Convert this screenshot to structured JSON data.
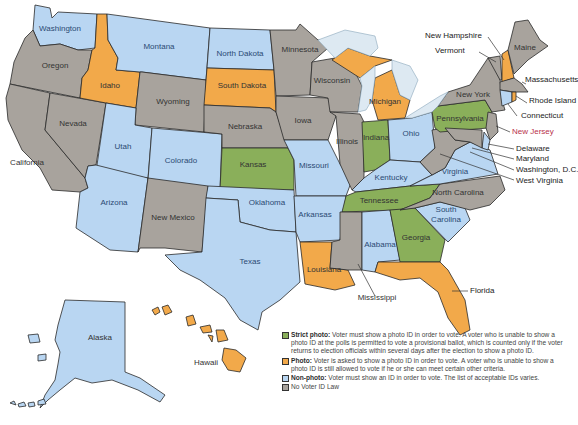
{
  "map": {
    "title": "Voter ID Laws by State",
    "colors": {
      "strict_photo": "#8aaf5a",
      "photo": "#f2a94a",
      "non_photo": "#b9d6f2",
      "none": "#a8a39d",
      "lakes": "#dde9f2"
    },
    "states": [
      {
        "name": "Washington",
        "category": "non_photo"
      },
      {
        "name": "Oregon",
        "category": "none"
      },
      {
        "name": "California",
        "category": "none"
      },
      {
        "name": "Idaho",
        "category": "photo"
      },
      {
        "name": "Nevada",
        "category": "none"
      },
      {
        "name": "Montana",
        "category": "non_photo"
      },
      {
        "name": "Wyoming",
        "category": "none"
      },
      {
        "name": "Utah",
        "category": "non_photo"
      },
      {
        "name": "Arizona",
        "category": "non_photo"
      },
      {
        "name": "Colorado",
        "category": "non_photo"
      },
      {
        "name": "New Mexico",
        "category": "none"
      },
      {
        "name": "North Dakota",
        "category": "non_photo"
      },
      {
        "name": "South Dakota",
        "category": "photo"
      },
      {
        "name": "Nebraska",
        "category": "none"
      },
      {
        "name": "Kansas",
        "category": "strict_photo"
      },
      {
        "name": "Oklahoma",
        "category": "non_photo"
      },
      {
        "name": "Texas",
        "category": "non_photo"
      },
      {
        "name": "Minnesota",
        "category": "none"
      },
      {
        "name": "Iowa",
        "category": "none"
      },
      {
        "name": "Missouri",
        "category": "non_photo"
      },
      {
        "name": "Arkansas",
        "category": "non_photo"
      },
      {
        "name": "Louisiana",
        "category": "photo"
      },
      {
        "name": "Wisconsin",
        "category": "none"
      },
      {
        "name": "Illinois",
        "category": "none"
      },
      {
        "name": "Michigan",
        "category": "photo"
      },
      {
        "name": "Indiana",
        "category": "strict_photo"
      },
      {
        "name": "Ohio",
        "category": "non_photo"
      },
      {
        "name": "Kentucky",
        "category": "non_photo"
      },
      {
        "name": "Tennessee",
        "category": "strict_photo"
      },
      {
        "name": "Mississippi",
        "category": "none"
      },
      {
        "name": "Alabama",
        "category": "non_photo"
      },
      {
        "name": "Georgia",
        "category": "strict_photo"
      },
      {
        "name": "Florida",
        "category": "photo"
      },
      {
        "name": "South Carolina",
        "category": "non_photo"
      },
      {
        "name": "North Carolina",
        "category": "none"
      },
      {
        "name": "Virginia",
        "category": "non_photo"
      },
      {
        "name": "West Virginia",
        "category": "none"
      },
      {
        "name": "Pennsylvania",
        "category": "strict_photo"
      },
      {
        "name": "New York",
        "category": "none"
      },
      {
        "name": "Vermont",
        "category": "none"
      },
      {
        "name": "New Hampshire",
        "category": "photo"
      },
      {
        "name": "Maine",
        "category": "none"
      },
      {
        "name": "Massachusetts",
        "category": "none"
      },
      {
        "name": "Rhode Island",
        "category": "photo"
      },
      {
        "name": "Connecticut",
        "category": "non_photo"
      },
      {
        "name": "New Jersey",
        "category": "none"
      },
      {
        "name": "Delaware",
        "category": "non_photo"
      },
      {
        "name": "Maryland",
        "category": "none"
      },
      {
        "name": "Washington, D.C.",
        "category": "none"
      },
      {
        "name": "Alaska",
        "category": "non_photo"
      },
      {
        "name": "Hawaii",
        "category": "photo"
      }
    ]
  },
  "labels": {
    "washington": "Washington",
    "oregon": "Oregon",
    "california": "California",
    "idaho": "Idaho",
    "nevada": "Nevada",
    "montana": "Montana",
    "wyoming": "Wyoming",
    "utah": "Utah",
    "arizona": "Arizona",
    "colorado": "Colorado",
    "new_mexico": "New Mexico",
    "north_dakota": "North Dakota",
    "south_dakota": "South Dakota",
    "nebraska": "Nebraska",
    "kansas": "Kansas",
    "oklahoma": "Oklahoma",
    "texas": "Texas",
    "minnesota": "Minnesota",
    "iowa": "Iowa",
    "missouri": "Missouri",
    "arkansas": "Arkansas",
    "louisiana": "Louisiana",
    "wisconsin": "Wisconsin",
    "illinois": "Illinois",
    "michigan": "Michigan",
    "indiana": "Indiana",
    "ohio": "Ohio",
    "kentucky": "Kentucky",
    "tennessee": "Tennessee",
    "mississippi": "Mississippi",
    "alabama": "Alabama",
    "georgia": "Georgia",
    "florida": "Florida",
    "south_carolina_1": "South",
    "south_carolina_2": "Carolina",
    "north_carolina": "North Carolina",
    "virginia": "Virginia",
    "west_virginia": "West Virginia",
    "pennsylvania": "Pennsylvania",
    "new_york": "New York",
    "vermont": "Vermont",
    "new_hampshire": "New Hampshire",
    "maine": "Maine",
    "massachusetts": "Massachusetts",
    "rhode_island": "Rhode Island",
    "connecticut": "Connecticut",
    "new_jersey": "New Jersey",
    "delaware": "Delaware",
    "maryland": "Maryland",
    "washington_dc": "Washington, D.C.",
    "alaska": "Alaska",
    "hawaii": "Hawaii"
  },
  "legend": [
    {
      "key": "strict_photo",
      "title": "Strict photo:",
      "text": " Voter must show a photo ID in order to vote. A voter who is unable to show a photo ID at the polls is permitted to vote a provisional ballot, which is counted only if the voter returns to election officials within several days after the election to show a photo ID.",
      "color": "#8aaf5a"
    },
    {
      "key": "photo",
      "title": "Photo:",
      "text": " Voter is asked to show a photo ID in order to vote. A voter who is unable to show a photo ID is still allowed to vote if he or she can meet certain other criteria.",
      "color": "#f2a94a"
    },
    {
      "key": "non_photo",
      "title": "Non-photo:",
      "text": " Voter must show an ID in order to vote. The list of acceptable IDs varies.",
      "color": "#b9d6f2"
    },
    {
      "key": "none",
      "title": "",
      "text": "No Voter ID Law",
      "color": "#a8a39d"
    }
  ]
}
